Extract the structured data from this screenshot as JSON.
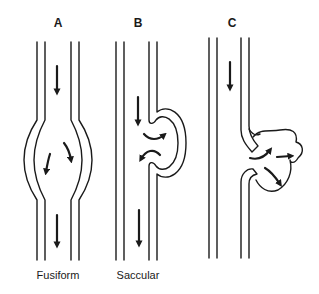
{
  "diagram": {
    "panels": [
      {
        "id": "A",
        "label": "A",
        "caption": "Fusiform"
      },
      {
        "id": "B",
        "label": "B",
        "caption": "Saccular"
      },
      {
        "id": "C",
        "label": "C",
        "caption": ""
      }
    ],
    "colors": {
      "line": "#1a1a1a",
      "background": "#ffffff"
    }
  }
}
